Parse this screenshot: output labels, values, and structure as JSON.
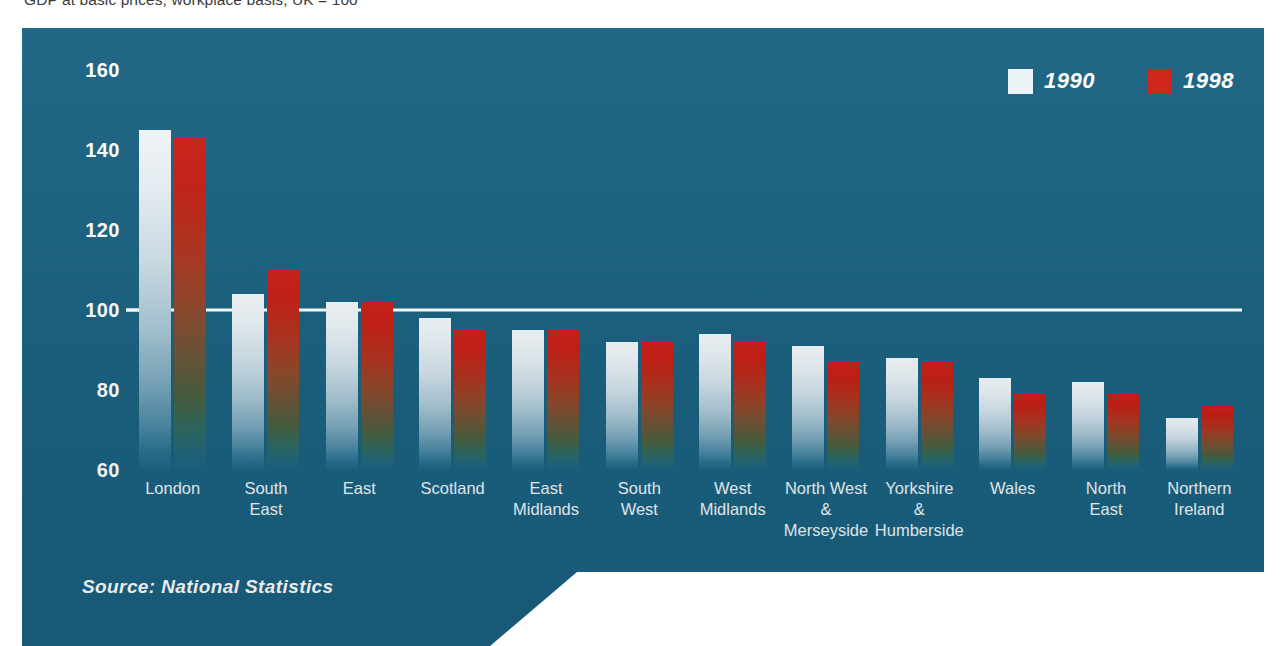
{
  "subtitle": "GDP at basic prices, workplace basis, UK = 100",
  "source": "Source: National Statistics",
  "colors": {
    "panel_teal": "#1a6281",
    "series_1990": "#edf4f8",
    "series_1998": "#cf1f16",
    "reference_line": "#ffffff",
    "axis_text": "#ffffff",
    "subtitle_text": "#3b3b3b",
    "page_background": "#ffffff"
  },
  "legend": {
    "position": "top-right",
    "items": [
      {
        "label": "1990",
        "swatch": "white"
      },
      {
        "label": "1998",
        "swatch": "red"
      }
    ]
  },
  "chart_data": {
    "type": "bar",
    "title": "GDP at basic prices, workplace basis, UK = 100",
    "xlabel": "",
    "ylabel": "",
    "ylim": [
      60,
      160
    ],
    "yticks": [
      160,
      140,
      120,
      100,
      80,
      60
    ],
    "grid": false,
    "reference_line_value": 100,
    "categories": [
      "London",
      "South\nEast",
      "East",
      "Scotland",
      "East\nMidlands",
      "South\nWest",
      "West\nMidlands",
      "North West\n&\nMerseyside",
      "Yorkshire\n&\nHumberside",
      "Wales",
      "North\nEast",
      "Northern\nIreland"
    ],
    "series": [
      {
        "name": "1990",
        "values": [
          145,
          104,
          102,
          98,
          95,
          92,
          94,
          91,
          88,
          83,
          82,
          73
        ]
      },
      {
        "name": "1998",
        "values": [
          143,
          110,
          102,
          95,
          95,
          92,
          92,
          87,
          87,
          79,
          79,
          76
        ]
      }
    ]
  }
}
